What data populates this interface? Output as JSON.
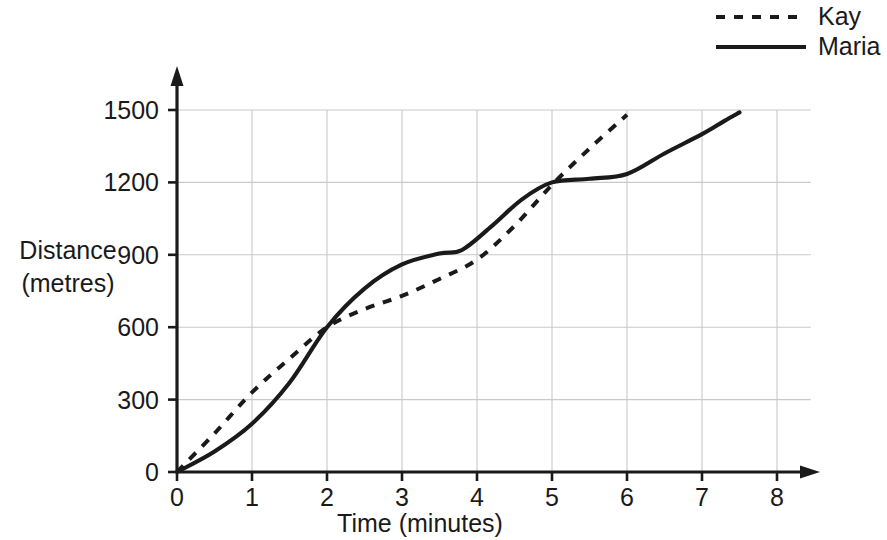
{
  "chart_data": {
    "type": "line",
    "title": "",
    "xlabel": "Time (minutes)",
    "ylabel": "Distance (metres)",
    "ylabel_line1": "Distance",
    "ylabel_line2": "(metres)",
    "xlim": [
      0,
      8
    ],
    "ylim": [
      0,
      1500
    ],
    "x_ticks": [
      0,
      1,
      2,
      3,
      4,
      5,
      6,
      7,
      8
    ],
    "x_tick_labels": [
      "0",
      "1",
      "2",
      "3",
      "4",
      "5",
      "6",
      "7",
      "8"
    ],
    "y_ticks": [
      0,
      300,
      600,
      900,
      1200,
      1500
    ],
    "y_tick_labels": [
      "0",
      "300",
      "600",
      "900",
      "1200",
      "1500"
    ],
    "grid": true,
    "grid_color": "#c9c9c9",
    "axis_color": "#1a1a1a",
    "legend_position": "top-right",
    "series": [
      {
        "name": "Kay",
        "style": "dashed",
        "color": "#1a1a1a",
        "x": [
          0,
          0.5,
          1,
          1.5,
          2,
          2.5,
          3,
          3.5,
          4,
          4.5,
          5,
          5.5,
          6
        ],
        "values": [
          0,
          160,
          330,
          470,
          600,
          675,
          730,
          800,
          880,
          1020,
          1190,
          1340,
          1480
        ]
      },
      {
        "name": "Maria",
        "style": "solid",
        "color": "#1a1a1a",
        "x": [
          0,
          0.5,
          1,
          1.5,
          2,
          2.5,
          3,
          3.5,
          3.8,
          4.2,
          4.6,
          5,
          5.5,
          6,
          6.5,
          7,
          7.3,
          7.5
        ],
        "values": [
          0,
          85,
          200,
          370,
          600,
          760,
          860,
          905,
          920,
          1020,
          1130,
          1200,
          1215,
          1235,
          1320,
          1400,
          1455,
          1490
        ]
      }
    ],
    "annotations": {
      "crossing_points": [
        {
          "x": 2,
          "y": 600
        },
        {
          "x": 5,
          "y": 1200
        }
      ]
    }
  },
  "legend": {
    "entries": [
      {
        "label": "Kay",
        "style": "dashed"
      },
      {
        "label": "Maria",
        "style": "solid"
      }
    ]
  }
}
